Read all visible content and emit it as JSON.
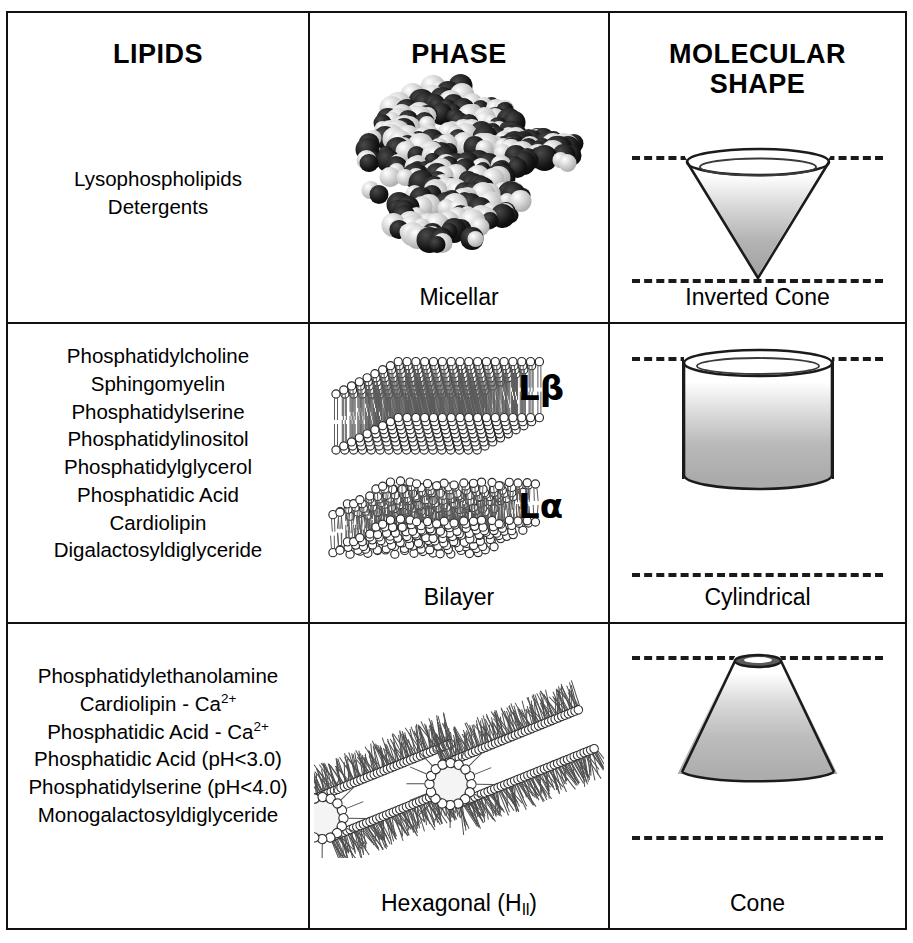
{
  "headers": {
    "lipids": "LIPIDS",
    "phase": "PHASE",
    "molecular_shape_line1": "MOLECULAR",
    "molecular_shape_line2": "SHAPE"
  },
  "rows": [
    {
      "id": "micellar",
      "lipids": [
        "Lysophospholipids",
        "Detergents"
      ],
      "phase_caption": "Micellar",
      "shape_caption": "Inverted Cone",
      "phase_icon": "micelle-spheres",
      "shape_icon": "inverted-cone"
    },
    {
      "id": "bilayer",
      "lipids": [
        "Phosphatidylcholine",
        "Sphingomyelin",
        "Phosphatidylserine",
        "Phosphatidylinositol",
        "Phosphatidylglycerol",
        "Phosphatidic Acid",
        "Cardiolipin",
        "Digalactosyldiglyceride"
      ],
      "phase_caption": "Bilayer",
      "shape_caption": "Cylindrical",
      "phase_icon": "lipid-bilayer-slabs",
      "shape_icon": "cylinder",
      "phase_labels": [
        {
          "base": "L",
          "greek": "β"
        },
        {
          "base": "L",
          "greek": "α"
        }
      ]
    },
    {
      "id": "hexagonal",
      "lipids": [
        {
          "text": "Phosphatidylethanolamine"
        },
        {
          "text": "Cardiolipin - Ca",
          "sup": "2+"
        },
        {
          "text": "Phosphatidic Acid - Ca",
          "sup": "2+"
        },
        {
          "text": "Phosphatidic Acid (pH<3.0)"
        },
        {
          "text": "Phosphatidylserine (pH<4.0)"
        },
        {
          "text": "Monogalactosyldiglyceride"
        }
      ],
      "phase_caption_main": "Hexagonal (H",
      "phase_caption_sub": "II",
      "phase_caption_tail": ")",
      "shape_caption": "Cone",
      "phase_icon": "inverted-hexagonal-tubes",
      "shape_icon": "truncated-cone"
    }
  ],
  "colors": {
    "border": "#111111",
    "text": "#000000",
    "shape_outline": "#1b1b1b",
    "shape_fill_light": "#ffffff",
    "shape_fill_dark": "#a8a8a8",
    "dash_line": "#1a1a1a"
  }
}
